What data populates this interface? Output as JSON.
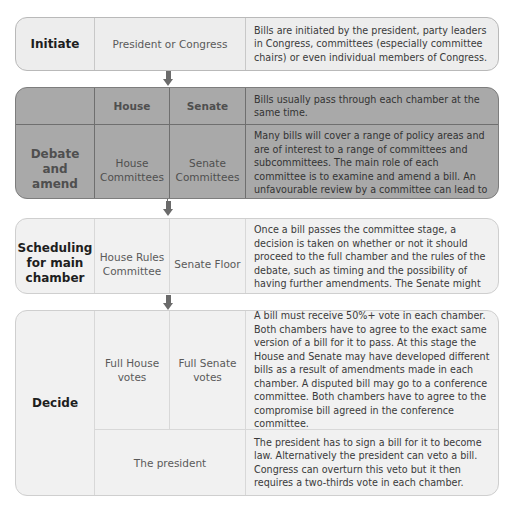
{
  "stages": [
    {
      "name": "Initiate",
      "actor": "President or Congress",
      "description": "Bills are initiated by the president, party leaders in Congress, committees (especially committee chairs) or even individual members of Congress."
    },
    {
      "name": "Debate and amend",
      "headers": {
        "house": "House",
        "senate": "Senate"
      },
      "header_description": "Bills usually pass through each chamber at the same time.",
      "house": "House Committees",
      "senate": "Senate Committees",
      "description": "Many bills will cover a range of policy areas and are of interest to a range of committees and subcommittees. The main role of each committee is to examine and amend a bill. An unfavourable review by a committee can lead to the bill failing."
    },
    {
      "name": "Scheduling for main chamber",
      "house": "House Rules Committee",
      "senate": "Senate Floor",
      "description": "Once a bill passes the committee stage, a decision is taken on whether or not it should proceed to the full chamber and the rules of the debate, such as timing and the possibility of having further amendments. The Senate might make use of unanimous consent."
    },
    {
      "name": "Decide",
      "house": "Full House votes",
      "senate": "Full Senate votes",
      "description": "A bill must receive 50%+ vote in each chamber. Both chambers have to agree to the exact same version of a bill for it to pass. At this stage the House and Senate may have developed different bills as a result of amendments made in each chamber. A disputed bill may go to a conference committee. Both chambers have to agree to the compromise bill agreed in the conference committee.",
      "president": "The president",
      "president_description": "The president has to sign a bill for it to become law. Alternatively the president can veto a bill. Congress can overturn this veto but it then requires a two-thirds vote in each chamber."
    }
  ],
  "colors": {
    "initiate_bg": "#ededed",
    "debate_bg": "#a9a9a9",
    "later_bg": "#f1f1f1",
    "arrow": "#6b6b6b"
  }
}
